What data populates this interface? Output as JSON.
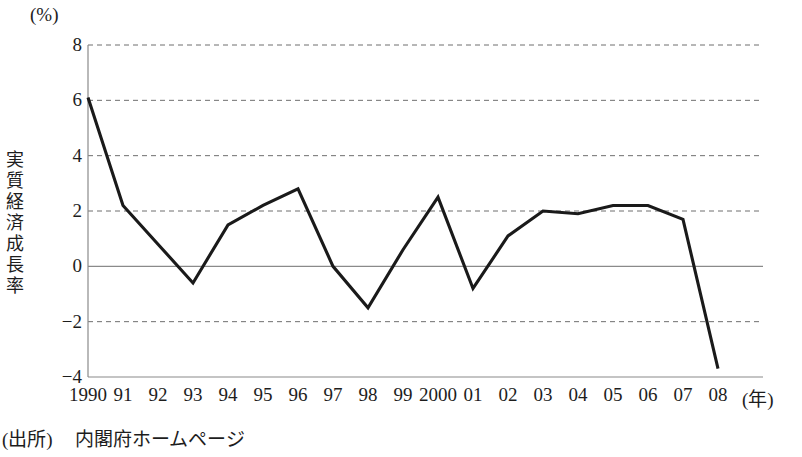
{
  "chart_data": {
    "type": "line",
    "title": "",
    "subtitle": "",
    "unit_label": "(%)",
    "ylabel": "実質経済成長率",
    "xlabel": "(年)",
    "categories": [
      "1990",
      "91",
      "92",
      "93",
      "94",
      "95",
      "96",
      "97",
      "98",
      "99",
      "2000",
      "01",
      "02",
      "03",
      "04",
      "05",
      "06",
      "07",
      "08"
    ],
    "x": [
      1990,
      1991,
      1992,
      1993,
      1994,
      1995,
      1996,
      1997,
      1998,
      1999,
      2000,
      2001,
      2002,
      2003,
      2004,
      2005,
      2006,
      2007,
      2008
    ],
    "values": [
      6.1,
      2.2,
      0.8,
      -0.6,
      1.5,
      2.2,
      2.8,
      0.0,
      -1.5,
      0.6,
      2.5,
      -0.8,
      1.1,
      2.0,
      1.9,
      2.2,
      2.2,
      1.7,
      -3.7
    ],
    "series": [
      {
        "name": "実質経済成長率",
        "values": [
          6.1,
          2.2,
          0.8,
          -0.6,
          1.5,
          2.2,
          2.8,
          0.0,
          -1.5,
          0.6,
          2.5,
          -0.8,
          1.1,
          2.0,
          1.9,
          2.2,
          2.2,
          1.7,
          -3.7
        ],
        "color": "#1a1a1a"
      }
    ],
    "ylim": [
      -4,
      8
    ],
    "yticks": [
      8,
      6,
      4,
      2,
      0,
      -2,
      -4
    ],
    "ytick_labels": [
      "8",
      "6",
      "4",
      "2",
      "0",
      "−2",
      "−4"
    ],
    "grid": "horizontal-dashed",
    "zero_line": true,
    "legend": "none",
    "legend_position": "none"
  },
  "source": {
    "label": "(出所)",
    "text": "内閣府ホームページ"
  },
  "axis_title_chars": [
    "実",
    "質",
    "経",
    "済",
    "成",
    "長",
    "率"
  ]
}
